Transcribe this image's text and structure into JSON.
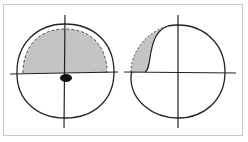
{
  "figure": {
    "panels": [
      {
        "name": "left-visual-field",
        "description": "Upper half shaded with dashed outer boundary; dark spot below center",
        "center": [
          65,
          73
        ],
        "radius": 48,
        "shade_color": "#c4c4c4",
        "spot_color": "#111111"
      },
      {
        "name": "right-visual-field",
        "description": "Upper-left crescent shaded along circle edge",
        "center": [
          178,
          73
        ],
        "radius": 47,
        "shade_color": "#c4c4c4"
      }
    ],
    "line_color": "#222222",
    "frame_color": "#c8c8c8"
  }
}
